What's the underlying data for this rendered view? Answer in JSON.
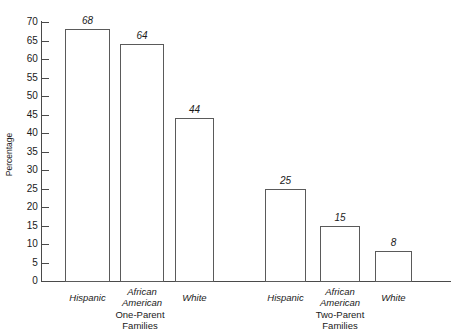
{
  "chart_data": {
    "type": "bar",
    "title": "",
    "subtitle": "",
    "xlabel": "",
    "ylabel": "Percentage",
    "ylim": [
      0,
      70
    ],
    "ytick_step": 5,
    "yticks": [
      70,
      65,
      60,
      55,
      50,
      45,
      40,
      35,
      30,
      25,
      20,
      15,
      10,
      5,
      0
    ],
    "grid": false,
    "legend": "none",
    "categories": [
      "Hispanic",
      "African American",
      "White"
    ],
    "group_labels": [
      "One-Parent Families",
      "Two-Parent Families"
    ],
    "series": [
      {
        "name": "One-Parent Families",
        "values": [
          68,
          64,
          44
        ]
      },
      {
        "name": "Two-Parent Families",
        "values": [
          25,
          15,
          8
        ]
      }
    ],
    "bars": [
      {
        "group": "One-Parent Families",
        "category": "Hispanic",
        "value": 68,
        "label": "68",
        "cat_line1": "Hispanic",
        "cat_line2": ""
      },
      {
        "group": "One-Parent Families",
        "category": "African American",
        "value": 64,
        "label": "64",
        "cat_line1": "African",
        "cat_line2": "American"
      },
      {
        "group": "One-Parent Families",
        "category": "White",
        "value": 44,
        "label": "44",
        "cat_line1": "White",
        "cat_line2": ""
      },
      {
        "group": "Two-Parent Families",
        "category": "Hispanic",
        "value": 25,
        "label": "25",
        "cat_line1": "Hispanic",
        "cat_line2": ""
      },
      {
        "group": "Two-Parent Families",
        "category": "African American",
        "value": 15,
        "label": "15",
        "cat_line1": "African",
        "cat_line2": "American"
      },
      {
        "group": "Two-Parent Families",
        "category": "White",
        "value": 8,
        "label": "8",
        "cat_line1": "White",
        "cat_line2": ""
      }
    ],
    "group_label_lines": [
      {
        "line1": "One-Parent",
        "line2": "Families"
      },
      {
        "line1": "Two-Parent",
        "line2": "Families"
      }
    ],
    "colors": {
      "bar_fill": "#ffffff",
      "bar_stroke": "#5a5a5a",
      "axis": "#4a4a4a",
      "text": "#1a1a1a",
      "background": "#ffffff"
    }
  }
}
